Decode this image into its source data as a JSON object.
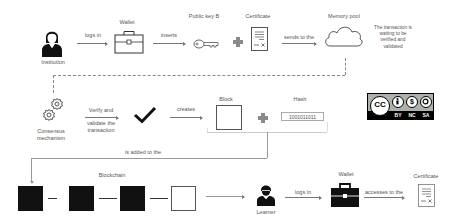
{
  "diagram": {
    "row1": {
      "institution_label": "Institution",
      "logs_in_label": "logs in",
      "wallet_label": "Wallet",
      "inserts_label": "inserts",
      "public_key_label": "Public key B",
      "certificate_label": "Certificate",
      "sends_to_label": "sends to the",
      "memory_pool_label": "Memory pool",
      "memory_pool_note": [
        "The transaction is",
        "waiting to be",
        "verified and",
        "validated"
      ]
    },
    "row2": {
      "consensus_label": [
        "Consensus",
        "mechanism"
      ],
      "verify_label_top": "Verify and",
      "verify_label_bottom": [
        "validate the",
        "transaction"
      ],
      "creates_label": "creates",
      "block_label": "Block",
      "hash_label": "Hash",
      "hash_value": "1001011011",
      "license": {
        "badge": "CC",
        "terms": [
          "BY",
          "NC",
          "SA"
        ]
      }
    },
    "row3": {
      "added_to_label": "is added to the",
      "blockchain_label": "Blockchain",
      "learner_label": "Learner",
      "logs_in_label": "logs in",
      "wallet_label": "Wallet",
      "accesses_label": "accesses to the",
      "certificate_label": "Certificate",
      "chain_blocks": [
        "filled",
        "filled",
        "filled",
        "empty"
      ]
    },
    "colors": {
      "icon_dark": "#111111",
      "line": "#777777",
      "plus": "#8a8a8a"
    }
  }
}
